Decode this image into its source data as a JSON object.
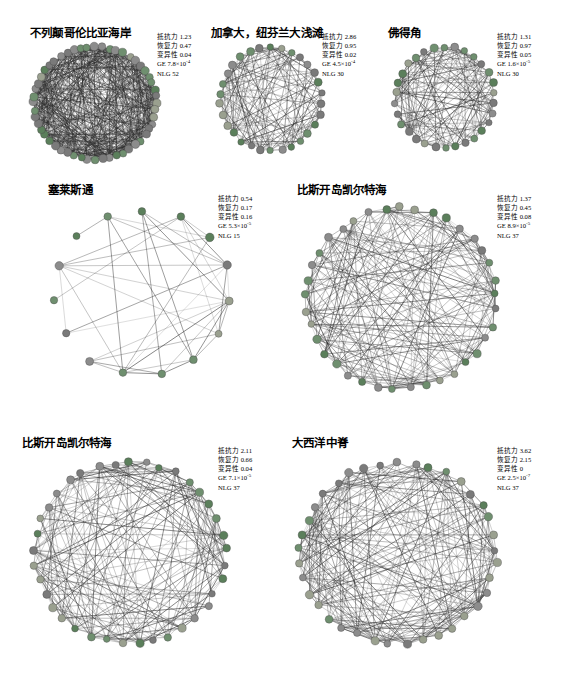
{
  "figure": {
    "background": "#ffffff",
    "metric_labels": {
      "resistance": "抵抗力",
      "recovery": "恢复力",
      "variability": "变异性",
      "ge": "GE",
      "nlg": "NLG"
    },
    "node_colors": [
      "#8c8c8c",
      "#6f8f6f",
      "#5b7f5b",
      "#9aa08f",
      "#7a7a7a"
    ],
    "edge_color": "#2b2b2b"
  },
  "panels": [
    {
      "id": "british-columbia-coast",
      "title": "不列颠哥伦比亚海岸",
      "metrics": {
        "resistance": "抵抗力 1.23",
        "recovery": "恢复力 0.47",
        "variability": "变异性 0.04",
        "ge": "GE 7.8×10",
        "ge_exp": "-4",
        "nlg": "NLG 52"
      },
      "nodes": 52,
      "density": "very-high"
    },
    {
      "id": "canada-newfoundland-grand-banks",
      "title": "加拿大，纽芬兰大浅滩",
      "metrics": {
        "resistance": "抵抗力 2.86",
        "recovery": "恢复力 0.95",
        "variability": "变异性 0.02",
        "ge": "GE 4.5×10",
        "ge_exp": "-4",
        "nlg": "NLG 30"
      },
      "nodes": 30,
      "density": "high"
    },
    {
      "id": "cape-verde",
      "title": "佛得角",
      "metrics": {
        "resistance": "抵抗力 1.31",
        "recovery": "恢复力 0.97",
        "variability": "变异性 0.05",
        "ge": "GE 1.6×10",
        "ge_exp": "-5",
        "nlg": "NLG 30"
      },
      "nodes": 30,
      "density": "high"
    },
    {
      "id": "celestun",
      "title": "塞莱斯通",
      "metrics": {
        "resistance": "抵抗力 0.54",
        "recovery": "恢复力 0.17",
        "variability": "变异性 0.16",
        "ge": "GE 5.3×10",
        "ge_exp": "-5",
        "nlg": "NLG 15"
      },
      "nodes": 15,
      "density": "low"
    },
    {
      "id": "biscay-celtic-sea-upper",
      "title": "比斯开岛凯尔特海",
      "metrics": {
        "resistance": "抵抗力 1.37",
        "recovery": "恢复力 0.45",
        "variability": "变异性 0.08",
        "ge": "GE 8.9×10",
        "ge_exp": "-5",
        "nlg": "NLG 37"
      },
      "nodes": 37,
      "density": "high"
    },
    {
      "id": "biscay-celtic-sea-lower",
      "title": "比斯开岛凯尔特海",
      "metrics": {
        "resistance": "抵抗力 2.11",
        "recovery": "恢复力 0.66",
        "variability": "变异性 0.04",
        "ge": "GE 7.1×10",
        "ge_exp": "-5",
        "nlg": "NLG 37"
      },
      "nodes": 37,
      "density": "high"
    },
    {
      "id": "mid-atlantic-ridge",
      "title": "大西洋中脊",
      "metrics": {
        "resistance": "抵抗力 3.62",
        "recovery": "恢复力 2.15",
        "variability": "变异性 0",
        "ge": "GE 2.5×10",
        "ge_exp": "-7",
        "nlg": "NLG 37"
      },
      "nodes": 37,
      "density": "high"
    }
  ]
}
